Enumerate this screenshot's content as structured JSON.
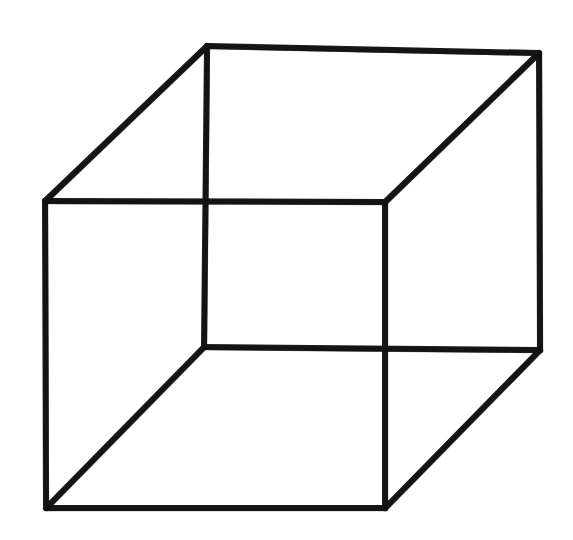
{
  "figure": {
    "name": "Necker cube",
    "kind": "line-drawing",
    "style": "hand-drawn ink wireframe",
    "canvas": {
      "width": 573,
      "height": 540
    },
    "background_color": "#ffffff",
    "stroke_color": "#1a1a1a",
    "stroke_width": 6,
    "vertices": {
      "front_top_left": [
        45,
        201
      ],
      "front_top_right": [
        385,
        202
      ],
      "front_bottom_right": [
        385,
        508
      ],
      "front_bottom_left": [
        46,
        508
      ],
      "back_top_left": [
        207,
        46
      ],
      "back_top_right": [
        539,
        53
      ],
      "back_bottom_right": [
        540,
        350
      ],
      "back_bottom_left": [
        204,
        347
      ]
    },
    "edges": [
      {
        "name": "front-top",
        "points": "45,201 385,202",
        "width": 6
      },
      {
        "name": "front-right",
        "points": "385,202 385,508",
        "width": 6
      },
      {
        "name": "front-bottom",
        "points": "46,508 385,508",
        "width": 6
      },
      {
        "name": "front-left",
        "points": "45,201 46,508",
        "width": 6
      },
      {
        "name": "back-top",
        "points": "207,46 539,53",
        "width": 6
      },
      {
        "name": "back-right",
        "points": "539,53 540,350",
        "width": 6
      },
      {
        "name": "back-bottom",
        "points": "204,347 540,350",
        "width": 6
      },
      {
        "name": "back-left",
        "points": "207,46 204,347",
        "width": 6
      },
      {
        "name": "connector-top-left",
        "points": "45,201 207,46",
        "width": 6
      },
      {
        "name": "connector-top-right",
        "points": "385,202 539,53",
        "width": 6
      },
      {
        "name": "connector-bottom-right",
        "points": "385,508 540,350",
        "width": 6
      },
      {
        "name": "connector-bottom-left",
        "points": "46,508 204,347",
        "width": 6
      }
    ],
    "crossings": [
      {
        "name": "upper-left-crossing",
        "point": [
          206,
          199
        ]
      },
      {
        "name": "lower-right-crossing",
        "point": [
          383,
          349
        ]
      }
    ]
  }
}
